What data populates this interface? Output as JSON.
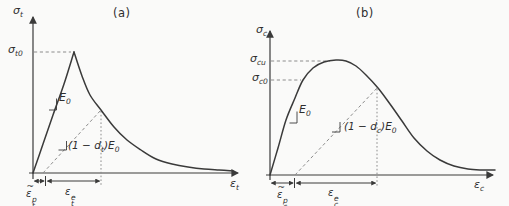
{
  "figure": {
    "background": "#fafaf9",
    "line_color": "#3a3a3a",
    "dash_color": "#8c8c8c",
    "panels": [
      {
        "title": "(a)",
        "y_axis_label": {
          "base": "σ",
          "sub": "t"
        },
        "x_axis_label": {
          "base": "ε",
          "sub": "t"
        },
        "peak_stress": {
          "base": "σ",
          "sub": "t0"
        },
        "initial_modulus": {
          "base": "E",
          "sub": "0"
        },
        "damaged_modulus": {
          "pre": "(1 − ",
          "var": "d",
          "var_sub": "t",
          "post": ")",
          "base": "E",
          "sub": "0"
        },
        "plastic_strain": {
          "tilde": "~",
          "base": "ε",
          "sub": "t",
          "sup": "p"
        },
        "elastic_strain": {
          "base": "ε",
          "sub": "t",
          "sup": "e"
        }
      },
      {
        "title": "(b)",
        "y_axis_label": {
          "base": "σ",
          "sub": "c"
        },
        "x_axis_label": {
          "base": "ε",
          "sub": "c"
        },
        "ultimate_stress": {
          "base": "σ",
          "sub": "cu"
        },
        "initial_yield_stress": {
          "base": "σ",
          "sub": "c0"
        },
        "initial_modulus": {
          "base": "E",
          "sub": "0"
        },
        "damaged_modulus": {
          "pre": "(1 − ",
          "var": "d",
          "var_sub": "c",
          "post": ")",
          "base": "E",
          "sub": "0"
        },
        "plastic_strain": {
          "tilde": "~",
          "base": "ε",
          "sub": "c",
          "sup": "p"
        },
        "elastic_strain": {
          "base": "ε",
          "sub": "c",
          "sup": "e"
        }
      }
    ],
    "chart_data": {
      "type": "line",
      "description": "Qualitative uniaxial tension (a) and compression (b) stress-strain response with initial modulus E0 and damaged unloading modulus (1-d)E0",
      "tension_rise": [
        [
          33,
          173
        ],
        [
          43,
          144
        ],
        [
          53,
          115
        ],
        [
          64,
          84
        ],
        [
          74,
          52
        ]
      ],
      "tension_soften": [
        [
          74,
          52
        ],
        [
          82,
          76
        ],
        [
          90,
          95
        ],
        [
          101,
          110
        ],
        [
          114,
          127
        ],
        [
          127,
          140
        ],
        [
          141,
          150
        ],
        [
          156,
          159
        ],
        [
          172,
          164
        ],
        [
          188,
          167
        ],
        [
          204,
          169
        ],
        [
          219,
          170
        ],
        [
          233,
          171
        ]
      ],
      "compression": [
        [
          270,
          175
        ],
        [
          278,
          148
        ],
        [
          286,
          120
        ],
        [
          295,
          98
        ],
        [
          303,
          80
        ],
        [
          313,
          68
        ],
        [
          324,
          62
        ],
        [
          336,
          60
        ],
        [
          346,
          61
        ],
        [
          356,
          66
        ],
        [
          366,
          75
        ],
        [
          378,
          88
        ],
        [
          390,
          104
        ],
        [
          402,
          121
        ],
        [
          414,
          138
        ],
        [
          427,
          151
        ],
        [
          440,
          160
        ],
        [
          454,
          166
        ],
        [
          468,
          169
        ],
        [
          482,
          170
        ],
        [
          495,
          170
        ]
      ]
    }
  }
}
